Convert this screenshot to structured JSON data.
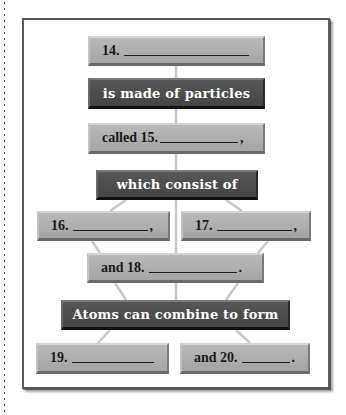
{
  "concept_map": {
    "nodes": {
      "n14": {
        "label": "14.",
        "suffix": ""
      },
      "made_of": {
        "label": "is made of particles"
      },
      "n15": {
        "label": "called 15.",
        "suffix": ","
      },
      "consist_of": {
        "label": "which consist of"
      },
      "n16": {
        "label": "16.",
        "suffix": ","
      },
      "n17": {
        "label": "17.",
        "suffix": ","
      },
      "n18": {
        "label": "and 18.",
        "suffix": "."
      },
      "combine": {
        "label": "Atoms can combine to form"
      },
      "n19": {
        "label": "19.",
        "suffix": ""
      },
      "n20": {
        "label": "and 20.",
        "suffix": "."
      }
    },
    "colors": {
      "light_box": "#aeaeae",
      "dark_box": "#4d4d4d",
      "frame_border": "#5a5a5a",
      "connector": "#c8c8c8"
    }
  }
}
